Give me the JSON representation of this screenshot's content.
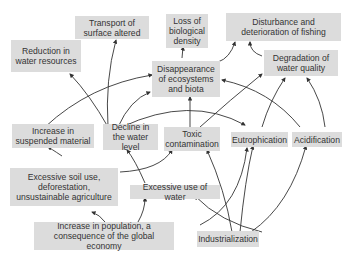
{
  "diagram": {
    "type": "cause-effect network",
    "nodes": {
      "transport": "Transport of surface altered",
      "loss_bio": "Loss of biological density",
      "disturbance": "Disturbance and deterioration of fishing",
      "reduction": "Reduction in water resources",
      "disappearance": "Disappearance of ecosystems and biota",
      "degradation": "Degradation of water quality",
      "increase_susp": "Increase in suspended material",
      "decline": "Decline in the water level",
      "toxic": "Toxic contamination",
      "eutrophication": "Eutrophication",
      "acidification": "Acidification",
      "soil_use": "Excessive soil use, deforestation, unsustainable agriculture",
      "excessive_water": "Excessive use of water",
      "population": "Increase in population, a consequence of the global economy",
      "industrialization": "Industrialization"
    },
    "edges": [
      [
        "decline",
        "reduction"
      ],
      [
        "decline",
        "transport"
      ],
      [
        "decline",
        "disappearance"
      ],
      [
        "increase_susp",
        "disappearance"
      ],
      [
        "disappearance",
        "loss_bio"
      ],
      [
        "disappearance",
        "disturbance"
      ],
      [
        "degradation",
        "disturbance"
      ],
      [
        "toxic",
        "disappearance"
      ],
      [
        "toxic",
        "degradation"
      ],
      [
        "decline",
        "eutrophication"
      ],
      [
        "eutrophication",
        "degradation"
      ],
      [
        "acidification",
        "degradation"
      ],
      [
        "eutrophication",
        "disappearance"
      ],
      [
        "soil_use",
        "increase_susp"
      ],
      [
        "soil_use",
        "toxic"
      ],
      [
        "excessive_water",
        "decline"
      ],
      [
        "population",
        "soil_use"
      ],
      [
        "population",
        "excessive_water"
      ],
      [
        "population",
        "industrialization"
      ],
      [
        "industrialization",
        "excessive_water"
      ],
      [
        "industrialization",
        "toxic"
      ],
      [
        "industrialization",
        "eutrophication"
      ],
      [
        "industrialization",
        "acidification"
      ],
      [
        "population",
        "eutrophication"
      ]
    ]
  }
}
